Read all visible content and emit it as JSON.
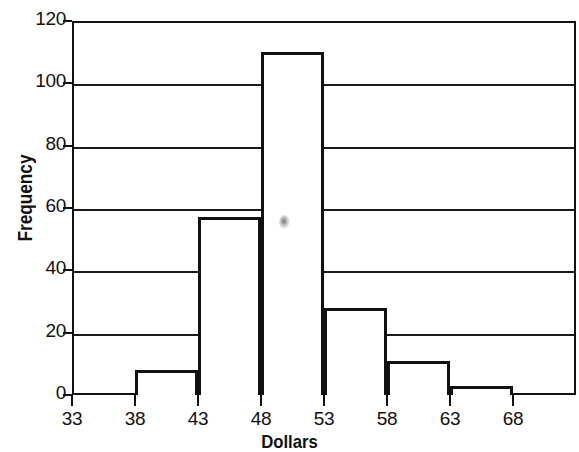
{
  "chart_data": {
    "type": "bar",
    "title": "",
    "xlabel": "Dollars",
    "ylabel": "Frequency",
    "categories": [
      "33-38",
      "38-43",
      "43-48",
      "48-53",
      "53-58",
      "58-63",
      "63-68"
    ],
    "bin_edges": [
      33,
      38,
      43,
      48,
      53,
      58,
      63,
      68
    ],
    "values": [
      0,
      8,
      57,
      110,
      28,
      11,
      3
    ],
    "bin_width": 5,
    "xlim": [
      33,
      73
    ],
    "ylim": [
      0,
      120
    ],
    "xticks": [
      "33",
      "38",
      "43",
      "48",
      "53",
      "58",
      "63",
      "68"
    ],
    "xtick_values": [
      33,
      38,
      43,
      48,
      53,
      58,
      63,
      68
    ],
    "yticks": [
      "0",
      "20",
      "40",
      "60",
      "80",
      "100",
      "120"
    ],
    "ytick_values": [
      0,
      20,
      40,
      60,
      80,
      100,
      120
    ],
    "grid": "horizontal",
    "legend": "none",
    "bar_fill": "#ffffff",
    "bar_edge": "#111111",
    "axis_color": "#111111",
    "background": "#ffffff"
  },
  "artifacts": {
    "smudge_label": "scan-speck"
  }
}
